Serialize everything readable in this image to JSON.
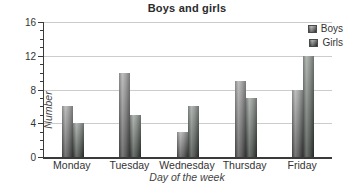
{
  "chart_data": {
    "type": "bar",
    "title": "Boys and girls",
    "xlabel": "Day of the week",
    "ylabel": "Number",
    "categories": [
      "Monday",
      "Tuesday",
      "Wednesday",
      "Thursday",
      "Friday"
    ],
    "series": [
      {
        "name": "Boys",
        "values": [
          6,
          10,
          3,
          9,
          8
        ],
        "color": "#7d7d7d"
      },
      {
        "name": "Girls",
        "values": [
          4,
          5,
          6,
          7,
          12
        ],
        "color": "#6b726d"
      }
    ],
    "ylim": [
      0,
      16
    ],
    "y_major_step": 4,
    "y_minor_step": 1,
    "grid": "horizontal",
    "legend_position": "top-right",
    "colors": {
      "grid": "#cccccc",
      "axis": "#3a3a3a",
      "text": "#333333",
      "title": "#2b2b2b"
    }
  }
}
